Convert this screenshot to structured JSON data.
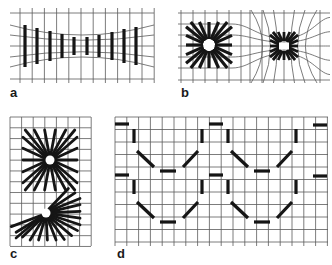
{
  "figure": {
    "colors": {
      "grid": "#5a5a5a",
      "stroke": "#151515",
      "background": "#ffffff"
    },
    "panels": [
      {
        "id": "a",
        "label": "a",
        "description": "Converging bars on pinched grid"
      },
      {
        "id": "b",
        "label": "b",
        "description": "Two radial clusters on distorted grid"
      },
      {
        "id": "c",
        "label": "c",
        "description": "Full and partial radial bursts on square grid"
      },
      {
        "id": "d",
        "label": "d",
        "description": "Dashed scalloped octagon pattern on square grid"
      }
    ]
  }
}
